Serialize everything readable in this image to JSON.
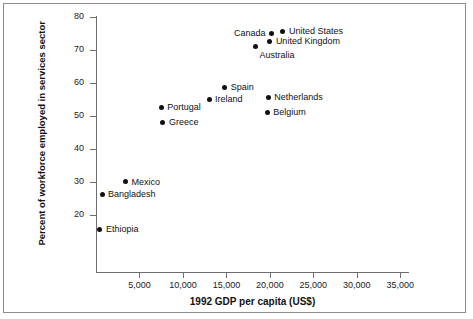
{
  "chart_data": {
    "type": "scatter",
    "title": "",
    "xlabel": "1992 GDP per capita (US$)",
    "ylabel": "Percent of workforce employed in services sector",
    "xlim": [
      0,
      36000
    ],
    "ylim": [
      13,
      81
    ],
    "xticks": [
      5000,
      10000,
      15000,
      20000,
      25000,
      30000,
      35000
    ],
    "xticklabels": [
      "5,000",
      "10,000",
      "15,000",
      "20,000",
      "25,000",
      "30,000",
      "35,000"
    ],
    "yticks": [
      20,
      30,
      40,
      50,
      60,
      70,
      80
    ],
    "yticklabels": [
      "20",
      "30",
      "40",
      "50",
      "60",
      "70",
      "80"
    ],
    "grid": false,
    "legend": "none",
    "marker_color": "#111111",
    "axis_color": "#6e6e6e",
    "points": [
      {
        "name": "United States",
        "x": 21500,
        "y": 75.5,
        "label_pos": "right"
      },
      {
        "name": "Canada",
        "x": 20200,
        "y": 75.0,
        "label_pos": "left"
      },
      {
        "name": "United Kingdom",
        "x": 20000,
        "y": 72.5,
        "label_pos": "right"
      },
      {
        "name": "Australia",
        "x": 18300,
        "y": 71.0,
        "label_pos": "below"
      },
      {
        "name": "Spain",
        "x": 14800,
        "y": 58.5,
        "label_pos": "right"
      },
      {
        "name": "Ireland",
        "x": 13000,
        "y": 55.0,
        "label_pos": "right"
      },
      {
        "name": "Netherlands",
        "x": 19800,
        "y": 55.5,
        "label_pos": "right"
      },
      {
        "name": "Belgium",
        "x": 19700,
        "y": 51.0,
        "label_pos": "right"
      },
      {
        "name": "Portugal",
        "x": 7500,
        "y": 52.5,
        "label_pos": "right"
      },
      {
        "name": "Greece",
        "x": 7700,
        "y": 48.0,
        "label_pos": "right"
      },
      {
        "name": "Mexico",
        "x": 3400,
        "y": 30.0,
        "label_pos": "right"
      },
      {
        "name": "Bangladesh",
        "x": 700,
        "y": 26.2,
        "label_pos": "right"
      },
      {
        "name": "Ethiopia",
        "x": 450,
        "y": 15.5,
        "label_pos": "right"
      }
    ]
  }
}
